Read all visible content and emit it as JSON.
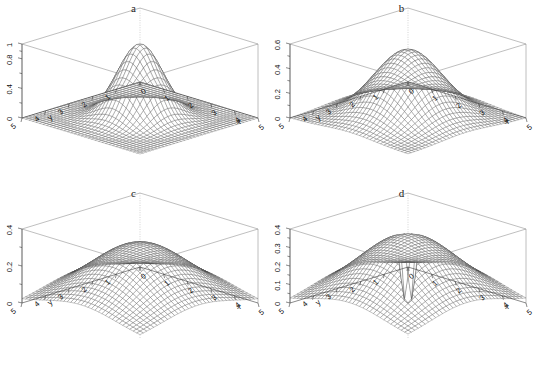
{
  "figure": {
    "background": "#ffffff",
    "layout": "2x2 grid of 3D perspective wireframe surface plots",
    "width": 535,
    "height": 370
  },
  "common": {
    "zlabel": "f(x,y)",
    "xlabel": "x",
    "ylabel": "y",
    "x_ticks": [
      "0",
      "1",
      "2",
      "3",
      "4",
      "5"
    ],
    "y_ticks": [
      "5",
      "4",
      "3",
      "2",
      "1",
      "0"
    ],
    "mesh_color": "#4a4a4a",
    "box_color": "#8a8a8a"
  },
  "panels": [
    {
      "id": "a",
      "title": "a",
      "zlabel": "f(x,y)",
      "xlabel": "x",
      "ylabel": "y",
      "z_ticks": [
        "0",
        "0.4",
        "0.8",
        "1"
      ],
      "z_tick_values": [
        0,
        0.4,
        0.8,
        1
      ],
      "zlim": [
        0,
        1
      ],
      "peak_height": 1,
      "peak_width": "narrow",
      "shape": "single sharp central peak at (2.5, 2.5) decaying to near zero at edges"
    },
    {
      "id": "b",
      "title": "b",
      "zlabel": "f(x,y)",
      "xlabel": "x",
      "ylabel": "y",
      "z_ticks": [
        "0",
        "0.2",
        "0.4",
        "0.6"
      ],
      "z_tick_values": [
        0,
        0.2,
        0.4,
        0.6
      ],
      "zlim": [
        0,
        0.6
      ],
      "peak_height": 0.6,
      "peak_width": "medium",
      "shape": "single central peak at (2.5, 2.5), broader and lower than panel a"
    },
    {
      "id": "c",
      "title": "c",
      "zlabel": "f(x,y)",
      "xlabel": "x",
      "ylabel": "y",
      "z_ticks": [
        "0",
        "0.2",
        "0.4"
      ],
      "z_tick_values": [
        0,
        0.2,
        0.4
      ],
      "zlim": [
        0,
        0.5
      ],
      "peak_height": 0.4,
      "peak_width": "broad",
      "shape": "broad low dome centred at (2.5, 2.5)"
    },
    {
      "id": "d",
      "title": "d",
      "zlabel": "f(x,y)",
      "xlabel": "x",
      "ylabel": "y",
      "z_ticks": [
        "0",
        "0.1",
        "0.2",
        "0.3",
        "0.4"
      ],
      "z_tick_values": [
        0,
        0.1,
        0.2,
        0.3,
        0.4
      ],
      "zlim": [
        0,
        0.45
      ],
      "peak_height": 0.4,
      "peak_width": "ridge",
      "shape": "annular ridge with a narrow downward spike (singularity) dropping to zero at the centre (2.5, 2.5)"
    }
  ],
  "chart_data": {
    "type": "line",
    "subtype": "3d-surface-wireframe",
    "title": "",
    "xlabel": "x",
    "ylabel": "y",
    "zlabel": "f(x,y)",
    "xlim": [
      0,
      5
    ],
    "ylim": [
      0,
      5
    ],
    "grid": false,
    "legend": "none",
    "panel_titles": [
      "a",
      "b",
      "c",
      "d"
    ],
    "series": [
      {
        "name": "a",
        "zlim": [
          0,
          1
        ],
        "z_ticks": [
          0,
          0.4,
          0.8,
          1
        ],
        "peak": {
          "x": 2.5,
          "y": 2.5,
          "z": 1.0
        },
        "form": "sharp narrow central peak, f -> 0 at boundary",
        "bandwidth": 0.55
      },
      {
        "name": "b",
        "zlim": [
          0,
          0.6
        ],
        "z_ticks": [
          0,
          0.2,
          0.4,
          0.6
        ],
        "peak": {
          "x": 2.5,
          "y": 2.5,
          "z": 0.6
        },
        "form": "moderate central peak, wider than a",
        "bandwidth": 0.9
      },
      {
        "name": "c",
        "zlim": [
          0,
          0.5
        ],
        "z_ticks": [
          0,
          0.2,
          0.4
        ],
        "peak": {
          "x": 2.5,
          "y": 2.5,
          "z": 0.4
        },
        "form": "broad shallow dome",
        "bandwidth": 1.35
      },
      {
        "name": "d",
        "zlim": [
          0,
          0.45
        ],
        "z_ticks": [
          0,
          0.1,
          0.2,
          0.3,
          0.4
        ],
        "peak": {
          "x": 2.5,
          "y": 2.5,
          "z": 0.0
        },
        "ridge_height": 0.28,
        "form": "raised ring/ridge with deep narrow funnel to zero at centre",
        "bandwidth": 1.35
      }
    ]
  }
}
